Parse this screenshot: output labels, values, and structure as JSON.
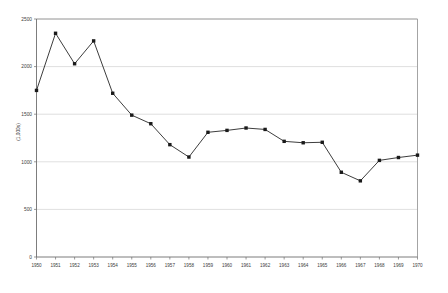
{
  "chart_data": {
    "type": "line",
    "title": "",
    "subtitle": "",
    "xlabel": "",
    "ylabel": "(1,000s)",
    "x": [
      1950,
      1951,
      1952,
      1953,
      1954,
      1955,
      1956,
      1957,
      1958,
      1959,
      1960,
      1961,
      1962,
      1963,
      1964,
      1965,
      1966,
      1967,
      1968,
      1969,
      1970
    ],
    "categories": [
      "1950",
      "1951",
      "1952",
      "1953",
      "1954",
      "1955",
      "1956",
      "1957",
      "1958",
      "1959",
      "1960",
      "1961",
      "1962",
      "1963",
      "1964",
      "1965",
      "1966",
      "1967",
      "1968",
      "1969",
      "1970"
    ],
    "values": [
      1750,
      2350,
      2030,
      2270,
      1720,
      1490,
      1400,
      1180,
      1050,
      1310,
      1330,
      1355,
      1340,
      1215,
      1200,
      1205,
      890,
      800,
      1015,
      1045,
      1070
    ],
    "series": [
      {
        "name": "series-1",
        "values": [
          1750,
          2350,
          2030,
          2270,
          1720,
          1490,
          1400,
          1180,
          1050,
          1310,
          1330,
          1355,
          1340,
          1215,
          1200,
          1205,
          890,
          800,
          1015,
          1045,
          1070
        ],
        "color": "#1a1a1a",
        "marker": "square"
      }
    ],
    "ylim": [
      0,
      2500
    ],
    "xlim": [
      1950,
      1970
    ],
    "y_ticks": [
      0,
      500,
      1000,
      1500,
      2000,
      2500
    ],
    "y_tick_labels": [
      "0",
      "500",
      "1000",
      "1500",
      "2000",
      "2500"
    ],
    "x_ticks": [
      1950,
      1951,
      1952,
      1953,
      1954,
      1955,
      1956,
      1957,
      1958,
      1959,
      1960,
      1961,
      1962,
      1963,
      1964,
      1965,
      1966,
      1967,
      1968,
      1969,
      1970
    ],
    "grid": {
      "horizontal": true,
      "vertical": false,
      "color": "#c9c9c9"
    },
    "legend": {
      "visible": false,
      "position": "none",
      "entries": []
    },
    "annotations": [],
    "colors": {
      "line": "#1a1a1a",
      "marker": "#1a1a1a",
      "gridline": "#c9c9c9",
      "axis": "#6e6e6e",
      "border": "#9a9a9a",
      "background": "#ffffff",
      "text": "#3c3c3c"
    }
  }
}
